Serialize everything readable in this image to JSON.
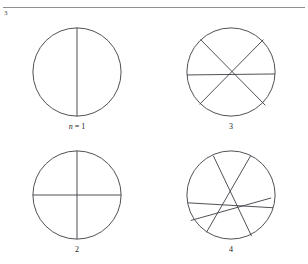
{
  "page": {
    "running_head": "",
    "corner_number": "3"
  },
  "figure": {
    "panels": [
      {
        "id": "panel-1",
        "label_prefix": "n",
        "label_equals": " = ",
        "label_value": "1",
        "label_text": "n = 1",
        "chord_count": 1,
        "region_count": 2
      },
      {
        "id": "panel-3",
        "label_prefix": "",
        "label_equals": "",
        "label_value": "3",
        "label_text": "3",
        "chord_count": 3,
        "region_count": 7
      },
      {
        "id": "panel-2",
        "label_prefix": "",
        "label_equals": "",
        "label_value": "2",
        "label_text": "2",
        "chord_count": 2,
        "region_count": 4
      },
      {
        "id": "panel-4",
        "label_prefix": "",
        "label_equals": "",
        "label_value": "4",
        "label_text": "4",
        "chord_count": 4,
        "region_count": 11
      }
    ]
  },
  "colors": {
    "ink": "#3c3c44",
    "rule": "#8d8f93",
    "text": "#1a1a1a",
    "background": "#ffffff"
  },
  "geometry": {
    "circle": {
      "cx": 50,
      "cy": 50,
      "r": 45
    },
    "chords": {
      "panel_1": [
        {
          "x1": 50,
          "y1": 5,
          "x2": 50,
          "y2": 95
        }
      ],
      "panel_2": [
        {
          "x1": 50,
          "y1": 5,
          "x2": 50,
          "y2": 95
        },
        {
          "x1": 5,
          "y1": 50,
          "x2": 95,
          "y2": 50
        }
      ],
      "panel_3": [
        {
          "x1": 19,
          "y1": 17,
          "x2": 85,
          "y2": 84
        },
        {
          "x1": 83,
          "y1": 17,
          "x2": 18,
          "y2": 83
        },
        {
          "x1": 5,
          "y1": 53,
          "x2": 95,
          "y2": 52
        }
      ],
      "panel_4": [
        {
          "x1": 32,
          "y1": 10,
          "x2": 71,
          "y2": 92
        },
        {
          "x1": 70,
          "y1": 10,
          "x2": 25,
          "y2": 88
        },
        {
          "x1": 6,
          "y1": 58,
          "x2": 93,
          "y2": 63
        },
        {
          "x1": 9,
          "y1": 76,
          "x2": 91,
          "y2": 53
        }
      ]
    }
  }
}
